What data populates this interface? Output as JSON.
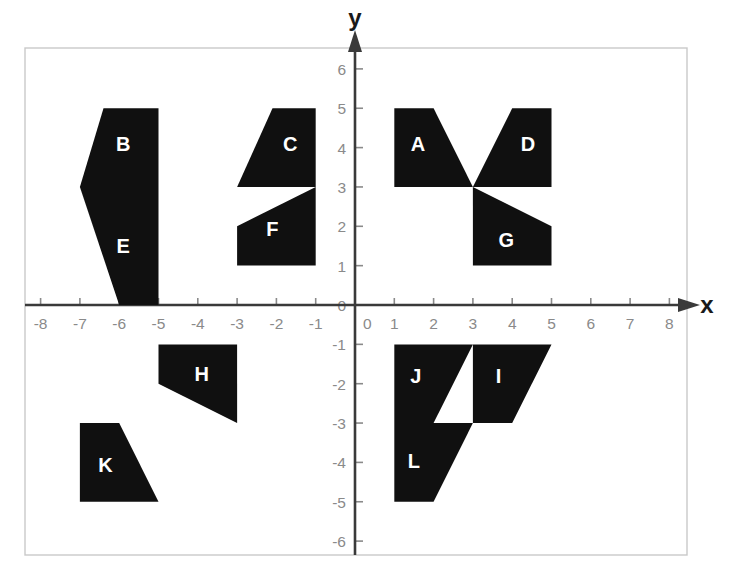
{
  "figure": {
    "title": "",
    "background_color": "#ffffff",
    "shape_fill_color": "#101010",
    "shape_label_color": "#ffffff",
    "axis_color": "#3a3a3a",
    "tick_color": "#8a8a8a",
    "frame_color": "#c9c9c9"
  },
  "axes": {
    "x_label": "x",
    "y_label": "y",
    "x_ticks": [
      "-8",
      "-7",
      "-6",
      "-5",
      "-4",
      "-3",
      "-2",
      "-1",
      "0",
      "1",
      "2",
      "3",
      "4",
      "5",
      "6",
      "7",
      "8"
    ],
    "x_tick_values": [
      -8,
      -7,
      -6,
      -5,
      -4,
      -3,
      -2,
      -1,
      0,
      1,
      2,
      3,
      4,
      5,
      6,
      7,
      8
    ],
    "y_ticks": [
      "-6",
      "-5",
      "-4",
      "-3",
      "-2",
      "-1",
      "0",
      "1",
      "2",
      "3",
      "4",
      "5",
      "6"
    ],
    "y_tick_values": [
      -6,
      -5,
      -4,
      -3,
      -2,
      -1,
      0,
      1,
      2,
      3,
      4,
      5,
      6
    ],
    "origin_label": "0",
    "xlim": [
      -8.4,
      8.4
    ],
    "ylim": [
      -6.5,
      6.3
    ],
    "grid": false
  },
  "chart_data": {
    "type": "scatter",
    "title": "",
    "xlabel": "x",
    "ylabel": "y",
    "xlim": [
      -8.4,
      8.4
    ],
    "ylim": [
      -6.5,
      6.3
    ],
    "grid": false,
    "legend": "none",
    "shapes": [
      {
        "label": "A",
        "quadrant": 1,
        "points": [
          [
            1,
            5
          ],
          [
            2,
            5
          ],
          [
            3,
            3
          ],
          [
            1,
            3
          ]
        ],
        "label_at": [
          1.6,
          4.05
        ]
      },
      {
        "label": "B",
        "quadrant": 2,
        "points": [
          [
            -6.4,
            5
          ],
          [
            -5,
            5
          ],
          [
            -5,
            3
          ],
          [
            -7,
            3
          ]
        ],
        "label_at": [
          -5.9,
          4.05
        ]
      },
      {
        "label": "C",
        "quadrant": 2,
        "points": [
          [
            -2.1,
            5
          ],
          [
            -1,
            5
          ],
          [
            -1,
            3
          ],
          [
            -3,
            3
          ]
        ],
        "label_at": [
          -1.65,
          4.05
        ]
      },
      {
        "label": "D",
        "quadrant": 1,
        "points": [
          [
            4,
            5
          ],
          [
            5,
            5
          ],
          [
            5,
            3
          ],
          [
            3,
            3
          ]
        ],
        "label_at": [
          4.4,
          4.05
        ]
      },
      {
        "label": "E",
        "quadrant": 2,
        "points": [
          [
            -7,
            3
          ],
          [
            -5,
            3
          ],
          [
            -5,
            0
          ],
          [
            -6,
            0
          ]
        ],
        "label_at": [
          -5.9,
          1.45
        ]
      },
      {
        "label": "F",
        "quadrant": 2,
        "points": [
          [
            -1,
            3
          ],
          [
            -1,
            1
          ],
          [
            -3,
            1
          ],
          [
            -3,
            2
          ]
        ],
        "label_at": [
          -2.1,
          1.9
        ]
      },
      {
        "label": "G",
        "quadrant": 1,
        "points": [
          [
            3,
            3
          ],
          [
            5,
            2
          ],
          [
            5,
            1
          ],
          [
            3,
            1
          ]
        ],
        "label_at": [
          3.85,
          1.6
        ]
      },
      {
        "label": "H",
        "quadrant": 3,
        "points": [
          [
            -5,
            -1
          ],
          [
            -3,
            -1
          ],
          [
            -3,
            -3
          ],
          [
            -5,
            -2
          ]
        ],
        "label_at": [
          -3.9,
          -1.8
        ]
      },
      {
        "label": "I",
        "quadrant": 4,
        "points": [
          [
            3,
            -1
          ],
          [
            5,
            -1
          ],
          [
            4,
            -3
          ],
          [
            3,
            -3
          ]
        ],
        "label_at": [
          3.65,
          -1.85
        ]
      },
      {
        "label": "J",
        "quadrant": 4,
        "points": [
          [
            1,
            -1
          ],
          [
            3,
            -1
          ],
          [
            2,
            -3
          ],
          [
            1,
            -3
          ]
        ],
        "label_at": [
          1.55,
          -1.85
        ]
      },
      {
        "label": "K",
        "quadrant": 3,
        "points": [
          [
            -7,
            -3
          ],
          [
            -6,
            -3
          ],
          [
            -5,
            -5
          ],
          [
            -7,
            -5
          ]
        ],
        "label_at": [
          -6.35,
          -4.1
        ]
      },
      {
        "label": "L",
        "quadrant": 4,
        "points": [
          [
            1,
            -3
          ],
          [
            3,
            -3
          ],
          [
            2,
            -5
          ],
          [
            1,
            -5
          ]
        ],
        "label_at": [
          1.5,
          -4.0
        ]
      }
    ]
  }
}
